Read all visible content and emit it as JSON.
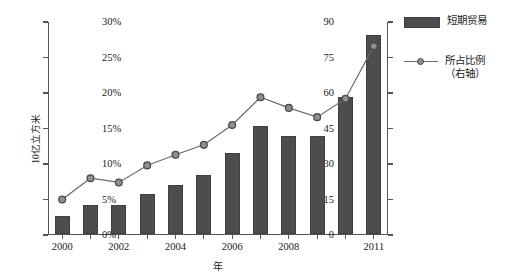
{
  "chart_data": {
    "type": "bar",
    "title": "",
    "subtitle": "",
    "xlabel": "年",
    "ylabel": "10亿立方米",
    "y2label": "",
    "categories": [
      "2000",
      "2001",
      "2002",
      "2003",
      "2004",
      "2005",
      "2006",
      "2007",
      "2008",
      "2009",
      "2010",
      "2011"
    ],
    "x_tick_labels": [
      "2000",
      "",
      "2002",
      "",
      "2004",
      "",
      "2006",
      "",
      "2008",
      "",
      "",
      "2011"
    ],
    "ylim": [
      0,
      90
    ],
    "y_ticks": [
      0,
      15,
      30,
      45,
      60,
      75,
      90
    ],
    "y_tick_labels": [
      "0",
      "15",
      "30",
      "45",
      "60",
      "75",
      "90"
    ],
    "y2lim": [
      0,
      30
    ],
    "y2_ticks": [
      0,
      5,
      10,
      15,
      20,
      25,
      30
    ],
    "y2_tick_labels": [
      "0%",
      "5%",
      "10%",
      "15%",
      "20%",
      "25%",
      "30%"
    ],
    "grid": false,
    "legend_position": "right",
    "series": [
      {
        "name": "短期贸易",
        "type": "bar",
        "axis": "left",
        "color": "#4d4d4d",
        "values": [
          7.5,
          12.0,
          12.0,
          17.0,
          20.5,
          25.0,
          34.0,
          45.5,
          41.5,
          41.5,
          58.0,
          84.0
        ]
      },
      {
        "name": "所占比例（右轴）",
        "type": "line",
        "axis": "right",
        "color": "#6b6b6b",
        "marker_fill": "#8f8f8f",
        "marker_edge": "#4a4a4a",
        "values": [
          5.0,
          8.0,
          7.4,
          9.8,
          11.3,
          12.7,
          15.5,
          19.4,
          17.9,
          16.6,
          19.2,
          26.6
        ]
      }
    ]
  },
  "legend": {
    "items": [
      {
        "label": "短期贸易",
        "sub": ""
      },
      {
        "label": "所占比例",
        "sub": "（右轴）"
      }
    ]
  },
  "colors": {
    "bar": "#4d4d4d",
    "line": "#6b6b6b",
    "marker_fill": "#8f8f8f",
    "marker_edge": "#4a4a4a",
    "axis": "#555555",
    "text": "#1a1a1a",
    "background": "#ffffff"
  }
}
